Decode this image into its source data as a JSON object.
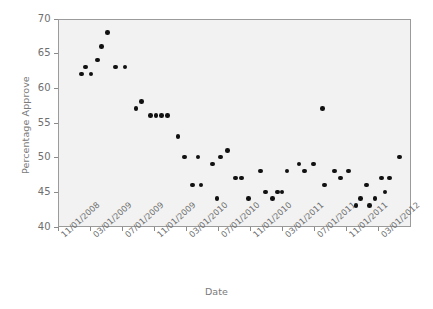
{
  "chart_data": {
    "type": "scatter",
    "title": "",
    "xlabel": "Date",
    "ylabel": "Percentage Approve",
    "ylim": [
      40,
      70
    ],
    "yticks": [
      40,
      45,
      50,
      55,
      60,
      65,
      70
    ],
    "xticks": [
      "11/01/2008",
      "03/01/2009",
      "07/01/2009",
      "11/01/2009",
      "03/01/2010",
      "07/01/2010",
      "11/01/2010",
      "03/01/2011",
      "07/01/2011",
      "11/01/2011",
      "03/01/2012"
    ],
    "xlim": [
      "11/01/2008",
      "05/01/2012"
    ],
    "grid": false,
    "legend": false,
    "marker": {
      "shape": "circle",
      "color": "#111111",
      "size": 4.6
    },
    "plot_background": "#f2f2f2",
    "figure_background": "#ffffff",
    "x_unit": "months_since_11/01/2008",
    "x_tick_positions_months": [
      0,
      4,
      8,
      12,
      16,
      20,
      24,
      28,
      32,
      36,
      40
    ],
    "points": [
      {
        "x": 3.0,
        "y": 62
      },
      {
        "x": 3.5,
        "y": 63
      },
      {
        "x": 4.2,
        "y": 62
      },
      {
        "x": 5.0,
        "y": 64
      },
      {
        "x": 5.5,
        "y": 66
      },
      {
        "x": 6.2,
        "y": 68
      },
      {
        "x": 7.2,
        "y": 63
      },
      {
        "x": 8.4,
        "y": 63
      },
      {
        "x": 9.8,
        "y": 57
      },
      {
        "x": 10.5,
        "y": 58
      },
      {
        "x": 11.6,
        "y": 56
      },
      {
        "x": 12.3,
        "y": 56
      },
      {
        "x": 13.0,
        "y": 56
      },
      {
        "x": 13.7,
        "y": 56
      },
      {
        "x": 15.0,
        "y": 53
      },
      {
        "x": 15.8,
        "y": 50
      },
      {
        "x": 16.8,
        "y": 46
      },
      {
        "x": 17.5,
        "y": 50
      },
      {
        "x": 17.9,
        "y": 46
      },
      {
        "x": 19.3,
        "y": 49
      },
      {
        "x": 19.9,
        "y": 44
      },
      {
        "x": 20.3,
        "y": 50
      },
      {
        "x": 21.2,
        "y": 51
      },
      {
        "x": 22.2,
        "y": 47
      },
      {
        "x": 22.9,
        "y": 47
      },
      {
        "x": 23.8,
        "y": 44
      },
      {
        "x": 25.3,
        "y": 48
      },
      {
        "x": 25.9,
        "y": 45
      },
      {
        "x": 26.8,
        "y": 44
      },
      {
        "x": 27.4,
        "y": 45
      },
      {
        "x": 28.0,
        "y": 45
      },
      {
        "x": 28.6,
        "y": 48
      },
      {
        "x": 30.1,
        "y": 49
      },
      {
        "x": 30.8,
        "y": 48
      },
      {
        "x": 31.9,
        "y": 49
      },
      {
        "x": 33.0,
        "y": 57
      },
      {
        "x": 33.3,
        "y": 46
      },
      {
        "x": 34.5,
        "y": 48
      },
      {
        "x": 35.3,
        "y": 47
      },
      {
        "x": 36.3,
        "y": 48
      },
      {
        "x": 37.2,
        "y": 43
      },
      {
        "x": 37.8,
        "y": 44
      },
      {
        "x": 38.5,
        "y": 46
      },
      {
        "x": 38.9,
        "y": 43
      },
      {
        "x": 39.6,
        "y": 44
      },
      {
        "x": 40.4,
        "y": 47
      },
      {
        "x": 40.8,
        "y": 45
      },
      {
        "x": 41.4,
        "y": 47
      },
      {
        "x": 42.6,
        "y": 50
      }
    ]
  }
}
